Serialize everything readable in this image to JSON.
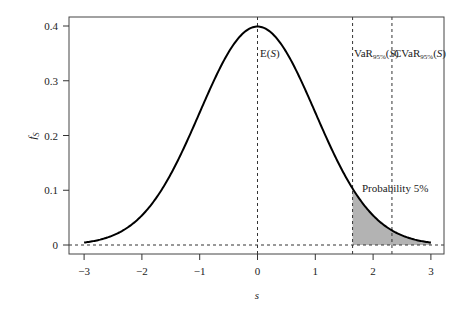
{
  "chart_data": {
    "type": "line",
    "title": "",
    "xlabel": "s",
    "ylabel": "f_S",
    "xlim": [
      -3.25,
      3.25
    ],
    "ylim": [
      -0.017,
      0.42
    ],
    "grid": false,
    "legend": null,
    "x_ticks": [
      -3,
      -2,
      -1,
      0,
      1,
      2,
      3
    ],
    "x_tick_labels": [
      "−3",
      "−2",
      "−1",
      "0",
      "1",
      "2",
      "3"
    ],
    "y_ticks": [
      0,
      0.1,
      0.2,
      0.3,
      0.4
    ],
    "y_tick_labels": [
      "0",
      "0.1",
      "0.2",
      "0.3",
      "0.4"
    ],
    "series": [
      {
        "name": "Standard normal density f_S(s)",
        "x": [
          -3.0,
          -2.5,
          -2.0,
          -1.5,
          -1.0,
          -0.5,
          0.0,
          0.5,
          1.0,
          1.5,
          1.645,
          2.0,
          2.326,
          2.5,
          3.0
        ],
        "values": [
          0.0044,
          0.0175,
          0.054,
          0.1295,
          0.242,
          0.3521,
          0.3989,
          0.3521,
          0.242,
          0.1295,
          0.1031,
          0.054,
          0.0267,
          0.0175,
          0.0044
        ]
      }
    ],
    "shaded_region": {
      "from": 1.645,
      "to": 3.0,
      "color": "#b3b3b3",
      "label": "Probability 5%"
    },
    "vertical_lines": [
      {
        "x": 0.0,
        "label": "E(S)",
        "style": "dashed"
      },
      {
        "x": 1.645,
        "label": "VaR95%(S)",
        "style": "dashed"
      },
      {
        "x": 2.326,
        "label": "CVaR95%(S)",
        "style": "dashed"
      }
    ],
    "horizontal_lines": [
      {
        "y": 0,
        "style": "dashed"
      }
    ],
    "annotations": {
      "mean": {
        "base": "E(",
        "var": "S",
        "close": ")"
      },
      "var": {
        "base": "VaR",
        "sub": "95%",
        "open": "(",
        "var": "S",
        "close": ")"
      },
      "cvar": {
        "base": "CVaR",
        "sub": "95%",
        "open": "(",
        "var": "S",
        "close": ")"
      },
      "prob": "Probability 5%"
    },
    "colors": {
      "curve": "#000000",
      "shade": "#b3b3b3",
      "axis": "#333333",
      "dash": "#333333"
    }
  }
}
